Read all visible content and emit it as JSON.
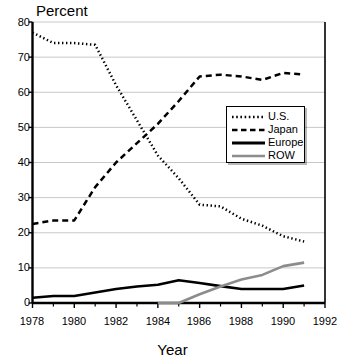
{
  "chart_data": {
    "type": "line",
    "title": "",
    "xlabel": "Year",
    "ylabel": "Percent",
    "xlim": [
      1978,
      1992
    ],
    "ylim": [
      0,
      80
    ],
    "grid": true,
    "grid_axis": "y",
    "legend_position": "center-right",
    "x_tick_labels": [
      "1978",
      "1980",
      "1982",
      "1984",
      "1986",
      "1988",
      "1990",
      "1992"
    ],
    "x_tick_values": [
      1978,
      1980,
      1982,
      1984,
      1986,
      1988,
      1990,
      1992
    ],
    "x_minor_ticks": [
      1979,
      1981,
      1983,
      1985,
      1987,
      1989,
      1991
    ],
    "y_tick_labels": [
      "0",
      "10",
      "20",
      "30",
      "40",
      "50",
      "60",
      "70",
      "80"
    ],
    "y_tick_values": [
      0,
      10,
      20,
      30,
      40,
      50,
      60,
      70,
      80
    ],
    "x": [
      1978,
      1979,
      1980,
      1981,
      1982,
      1983,
      1984,
      1985,
      1986,
      1987,
      1988,
      1989,
      1990,
      1991
    ],
    "series": [
      {
        "name": "U.S.",
        "style": "dotted",
        "color": "#000000",
        "values": [
          77,
          74,
          74,
          73.5,
          62,
          52,
          42,
          35.5,
          28,
          27.5,
          24,
          22,
          19,
          17.5
        ]
      },
      {
        "name": "Japan",
        "style": "dashed",
        "color": "#000000",
        "values": [
          22.5,
          23.5,
          23.5,
          33,
          40,
          45.5,
          51,
          57.5,
          64.5,
          65,
          64.5,
          63.5,
          65.5,
          65
        ]
      },
      {
        "name": "Europe",
        "style": "solid",
        "color": "#000000",
        "values": [
          1.5,
          2,
          2,
          3,
          4,
          4.7,
          5.2,
          6.5,
          5.7,
          4.8,
          4,
          4,
          4,
          5
        ]
      },
      {
        "name": "ROW",
        "style": "solid",
        "color": "#8c8c8c",
        "values": [
          null,
          null,
          null,
          null,
          null,
          null,
          0,
          0,
          2.5,
          4.7,
          6.7,
          8,
          10.5,
          11.5
        ]
      }
    ]
  },
  "legend": {
    "entries": [
      {
        "label": "U.S.",
        "swatch": "dotted-line-swatch"
      },
      {
        "label": "Japan",
        "swatch": "dashed-line-swatch"
      },
      {
        "label": "Europe",
        "swatch": "solid-black-line-swatch"
      },
      {
        "label": "ROW",
        "swatch": "solid-gray-line-swatch"
      }
    ]
  },
  "colors": {
    "axis": "#000000",
    "grid": "#c8c8c8",
    "row_series": "#8c8c8c",
    "background": "#ffffff"
  }
}
